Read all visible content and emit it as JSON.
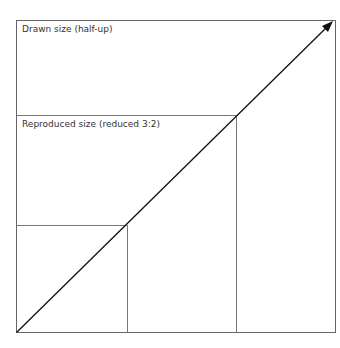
{
  "labels": {
    "drawn": "Drawn size (half-up)",
    "reproduced": "Reproduced size (reduced 3:2)"
  },
  "colors": {
    "line": "#555555",
    "arrow": "#111111"
  }
}
